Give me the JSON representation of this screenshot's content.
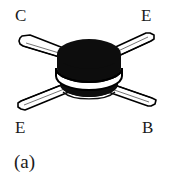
{
  "figure": {
    "caption": "(a)",
    "device_name": "four-lead-can-transistor",
    "background_color": "#ffffff",
    "ink_color": "#000000",
    "body_fill": "#0d0d0d",
    "lead_fill": "#ffffff",
    "lead_outline": "#000000",
    "width_px": 178,
    "height_px": 179
  },
  "pins": {
    "top_left": "C",
    "top_right": "E",
    "bottom_left": "E",
    "bottom_right": "B"
  },
  "parts": {
    "can_body": "transistor-can",
    "can_flange": "transistor-flange-band",
    "lead_top_left": "lead-collector",
    "lead_top_right": "lead-emitter-upper",
    "lead_bottom_left": "lead-emitter-lower",
    "lead_bottom_right": "lead-base"
  }
}
